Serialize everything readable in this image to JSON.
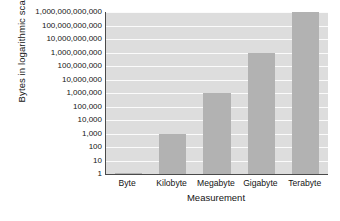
{
  "chart_data": {
    "type": "bar",
    "title": "",
    "xlabel": "Measurement",
    "ylabel": "Bytes in logarithmic scale",
    "scale": "log10",
    "grid": true,
    "legend": "none",
    "categories": [
      "Byte",
      "Kilobyte",
      "Megabyte",
      "Gigabyte",
      "Terabyte"
    ],
    "values": [
      1,
      1000,
      1000000,
      1000000000,
      1000000000000
    ],
    "value_labels": [
      "1",
      "1,000",
      "1,000,000",
      "1,000,000,000",
      "1,000,000,000,000"
    ],
    "ylim": [
      1,
      1000000000000
    ],
    "ytick_labels": [
      "1,000,000,000,000",
      "100,000,000,000",
      "10,000,000,000",
      "1,000,000,000",
      "100,000,000",
      "10,000,000",
      "1,000,000",
      "100,000",
      "10,000",
      "1,000",
      "100",
      "10",
      "1"
    ],
    "ytick_values": [
      1000000000000,
      100000000000,
      10000000000,
      1000000000,
      100000000,
      10000000,
      1000000,
      100000,
      10000,
      1000,
      100,
      10,
      1
    ],
    "colors": {
      "bar": "#b2b2b2",
      "plot_background": "#dddddd",
      "gridline": "#fbfbfb",
      "axis": "#4a4a4a",
      "text": "#141414",
      "page_background": "#ffffff"
    }
  }
}
